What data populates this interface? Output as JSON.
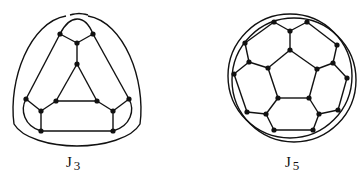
{
  "figure": {
    "graphs": [
      {
        "id": "J3",
        "label_main": "J",
        "label_sub": "3",
        "nodes": [
          [
            60,
            34
          ],
          [
            93,
            34
          ],
          [
            77,
            43
          ],
          [
            77,
            64
          ],
          [
            56,
            101
          ],
          [
            97,
            101
          ],
          [
            26,
            99
          ],
          [
            41,
            111
          ],
          [
            41,
            131
          ],
          [
            129,
            99
          ],
          [
            113,
            111
          ],
          [
            113,
            131
          ]
        ],
        "edges": [
          [
            0,
            2
          ],
          [
            1,
            2
          ],
          [
            2,
            3
          ],
          [
            3,
            4
          ],
          [
            3,
            5
          ],
          [
            4,
            5
          ],
          [
            0,
            6
          ],
          [
            1,
            9
          ],
          [
            6,
            7
          ],
          [
            7,
            4
          ],
          [
            7,
            8
          ],
          [
            9,
            10
          ],
          [
            10,
            5
          ],
          [
            10,
            11
          ],
          [
            8,
            11
          ]
        ],
        "outer_curves": [
          "M60,34 C70,14 85,14 93,34",
          "M26,99 C20,110 24,126 41,131",
          "M129,99 C135,110 131,126 113,131",
          "M66,16 C30,22 8,80 14,124 C22,138 50,146 77,146 C104,146 132,138 140,124 C146,80 124,22 88,16",
          "M70,15 C78,13 80,13 88,15"
        ]
      },
      {
        "id": "J5",
        "label_main": "J",
        "label_sub": "5",
        "nodes": [
          [
            274,
            22
          ],
          [
            307,
            22
          ],
          [
            290,
            31
          ],
          [
            290,
            50
          ],
          [
            245,
            43
          ],
          [
            249,
            62
          ],
          [
            234,
            74
          ],
          [
            268,
            68
          ],
          [
            337,
            45
          ],
          [
            333,
            63
          ],
          [
            347,
            78
          ],
          [
            317,
            69
          ],
          [
            278,
            98
          ],
          [
            309,
            98
          ],
          [
            247,
            112
          ],
          [
            266,
            114
          ],
          [
            319,
            114
          ],
          [
            338,
            110
          ],
          [
            274,
            130
          ],
          [
            313,
            130
          ]
        ],
        "edges": [
          [
            0,
            2
          ],
          [
            1,
            2
          ],
          [
            2,
            3
          ],
          [
            3,
            7
          ],
          [
            3,
            11
          ],
          [
            0,
            4
          ],
          [
            4,
            5
          ],
          [
            5,
            7
          ],
          [
            5,
            6
          ],
          [
            1,
            8
          ],
          [
            8,
            9
          ],
          [
            9,
            11
          ],
          [
            9,
            10
          ],
          [
            7,
            12
          ],
          [
            11,
            13
          ],
          [
            12,
            13
          ],
          [
            12,
            15
          ],
          [
            13,
            16
          ],
          [
            6,
            14
          ],
          [
            14,
            15
          ],
          [
            15,
            18
          ],
          [
            10,
            17
          ],
          [
            17,
            16
          ],
          [
            16,
            19
          ],
          [
            18,
            19
          ]
        ],
        "outer_circles": [
          {
            "cx": 290,
            "cy": 76,
            "r": 62
          },
          {
            "cx": 294,
            "cy": 80,
            "r": 62
          }
        ]
      }
    ],
    "labels": [
      {
        "text_main": "J",
        "text_sub": "3",
        "x": 66,
        "y": 154
      },
      {
        "text_main": "J",
        "text_sub": "5",
        "x": 285,
        "y": 154
      }
    ],
    "stroke_color": "#111111",
    "node_color": "#111111"
  }
}
